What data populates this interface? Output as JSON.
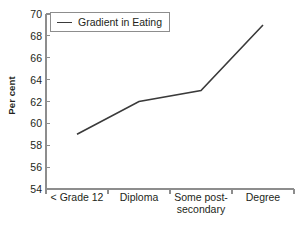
{
  "chart_data": {
    "type": "line",
    "title": "",
    "subtitle": "",
    "xlabel": "",
    "ylabel": "Per cent",
    "categories": [
      "< Grade 12",
      "Diploma",
      "Some post-\nsecondary",
      "Degree"
    ],
    "category_labels_flat": [
      "< Grade 12",
      "Diploma",
      "Some post-secondary",
      "Degree"
    ],
    "series": [
      {
        "name": "Gradient in Eating",
        "values": [
          59,
          62,
          63,
          69
        ],
        "color": "#3a3a3a"
      }
    ],
    "ylim": [
      54,
      70
    ],
    "yticks": [
      54,
      56,
      58,
      60,
      62,
      64,
      66,
      68,
      70
    ],
    "ytick_labels": [
      "54",
      "56",
      "58",
      "60",
      "62",
      "64",
      "66",
      "68",
      "70"
    ],
    "grid": false,
    "legend": {
      "position": "top-left",
      "entries": [
        "Gradient in Eating"
      ],
      "border_color": "#8d8d8d"
    },
    "axis_color": "#8d8d8d",
    "text_color": "#231f20",
    "background": "#ffffff"
  },
  "legend": {
    "label": "Gradient in Eating"
  },
  "axes": {
    "y_title": "Per cent"
  }
}
